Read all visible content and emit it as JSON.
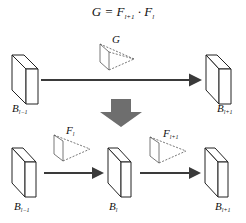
{
  "formula": {
    "lhs": "G",
    "eq": "=",
    "f1": "F",
    "f1_sub": "l+1",
    "dot": "·",
    "f2": "F",
    "f2_sub": "l"
  },
  "top_row": {
    "left_block": {
      "label": "B",
      "sub": "l−1"
    },
    "right_block": {
      "label": "B",
      "sub": "l+1"
    },
    "filter_label": "G"
  },
  "bottom_row": {
    "left_block": {
      "label": "B",
      "sub": "l−1"
    },
    "middle_block": {
      "label": "B",
      "sub": "l"
    },
    "right_block": {
      "label": "B",
      "sub": "l+1"
    },
    "filter_left_label": {
      "label": "F",
      "sub": "l"
    },
    "filter_right_label": {
      "label": "F",
      "sub": "l+1"
    }
  },
  "colors": {
    "arrow": "#3a3a3a",
    "down_arrow": "#6e6e6e",
    "stroke": "#222222",
    "filter_stroke": "#555555"
  }
}
